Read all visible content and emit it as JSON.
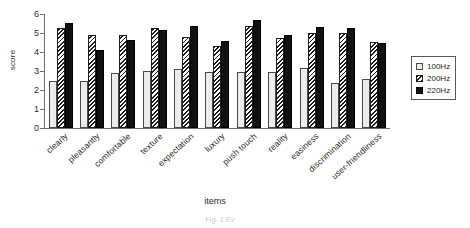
{
  "chart_data": {
    "type": "bar",
    "title": "",
    "xlabel": "items",
    "ylabel": "score",
    "ylim": [
      0,
      6
    ],
    "yticks": [
      0,
      1,
      2,
      3,
      4,
      5,
      6
    ],
    "grid": false,
    "legend_position": "right",
    "categories": [
      "clearly",
      "pleasantly",
      "comfortable",
      "texture",
      "expectation",
      "luxury",
      "push touch",
      "reality",
      "easiness",
      "discrimination",
      "user-friendliness"
    ],
    "series": [
      {
        "name": "100Hz",
        "values": [
          2.45,
          2.45,
          2.9,
          3.0,
          3.1,
          2.95,
          2.95,
          2.95,
          3.15,
          2.35,
          2.6
        ]
      },
      {
        "name": "200Hz",
        "values": [
          5.25,
          4.9,
          4.9,
          5.25,
          4.8,
          4.3,
          5.35,
          4.75,
          5.0,
          5.0,
          4.55
        ]
      },
      {
        "name": "220Hz",
        "values": [
          5.55,
          4.1,
          4.65,
          5.15,
          5.35,
          4.6,
          5.7,
          4.9,
          5.3,
          5.25,
          4.5
        ]
      }
    ]
  },
  "legend": {
    "items": [
      {
        "label": "100Hz",
        "style": "open",
        "color": "#ececec"
      },
      {
        "label": "200Hz",
        "style": "hatched",
        "color": "#1a1a1a"
      },
      {
        "label": "220Hz",
        "style": "solid",
        "color": "#111111"
      }
    ]
  },
  "caption": "Fig. 1  Ev"
}
